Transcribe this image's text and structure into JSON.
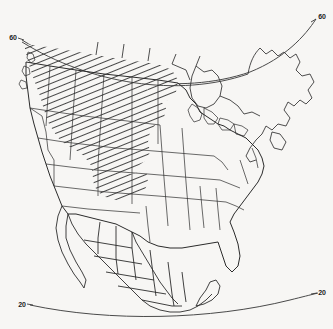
{
  "figure": {
    "background_color": "#f7f6f4",
    "line_color": "#2b2b2b",
    "hatch_color": "#1a1a1a"
  },
  "graticule": {
    "labels": [
      {
        "id": "lat-60-left",
        "text": "60",
        "x": 13,
        "y": 40
      },
      {
        "id": "lat-60-right",
        "text": "60",
        "x": 319,
        "y": 18
      },
      {
        "id": "lat-20-left",
        "text": "20",
        "x": 22,
        "y": 305
      },
      {
        "id": "lat-20-right",
        "text": "20",
        "x": 320,
        "y": 294
      }
    ],
    "parallels": [
      {
        "name": "parallel-60",
        "value": 60
      },
      {
        "name": "parallel-20",
        "value": 20
      }
    ]
  },
  "legend": {
    "hatched_region_name": "hatched-study-area"
  }
}
